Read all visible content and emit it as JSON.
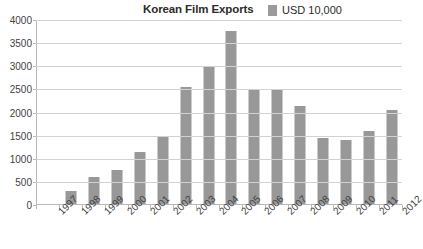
{
  "chart_data": {
    "type": "bar",
    "title": "Korean Film Exports",
    "xlabel": "",
    "ylabel": "",
    "ylim": [
      0,
      4000
    ],
    "ytick_step": 500,
    "yticks": [
      "4000",
      "3500",
      "3000",
      "2500",
      "2000",
      "1500",
      "1000",
      "500",
      "0"
    ],
    "ytick_values": [
      4000,
      3500,
      3000,
      2500,
      2000,
      1500,
      1000,
      500,
      0
    ],
    "grid": true,
    "legend_position": "top-right",
    "legend": [
      "USD 10,000"
    ],
    "series_color": "#989898",
    "categories": [
      "1997",
      "1998",
      "1999",
      "2000",
      "2001",
      "2002",
      "2003",
      "2004",
      "2005",
      "2006",
      "2007",
      "2008",
      "2009",
      "2010",
      "2011",
      "2012"
    ],
    "series": [
      {
        "name": "USD 10,000",
        "values": [
          25,
          310,
          600,
          750,
          1150,
          1500,
          2550,
          2980,
          3760,
          2500,
          2480,
          2150,
          1450,
          1400,
          1600,
          2050
        ]
      }
    ]
  },
  "header": {
    "title": "Korean Film Exports",
    "legend_label": "USD 10,000"
  },
  "colors": {
    "bar": "#989898",
    "gridline": "#d2d2d2",
    "axis": "#b9b9b9",
    "text": "#3f3f3f",
    "background": "#ffffff"
  }
}
